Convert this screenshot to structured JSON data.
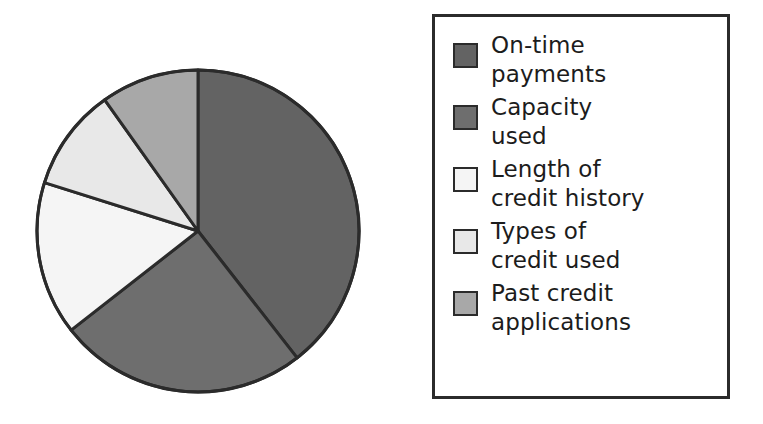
{
  "figure": {
    "kind": "pie-chart-with-legend",
    "background_color": "#ffffff",
    "outline_color": "#2b2b2b"
  },
  "legend": {
    "border_color": "#2b2b2b",
    "position": "right",
    "items": [
      {
        "label": "On-time\npayments",
        "color": "#636363",
        "swatch_name": "legend-swatch-on-time-payments"
      },
      {
        "label": "Capacity\nused",
        "color": "#6e6e6e",
        "swatch_name": "legend-swatch-capacity-used"
      },
      {
        "label": "Length of\ncredit history",
        "color": "#f5f5f5",
        "swatch_name": "legend-swatch-length-of-credit-history"
      },
      {
        "label": "Types of\ncredit used",
        "color": "#e8e8e8",
        "swatch_name": "legend-swatch-types-of-credit-used"
      },
      {
        "label": "Past credit\napplications",
        "color": "#a8a8a8",
        "swatch_name": "legend-swatch-past-credit-applications"
      }
    ]
  },
  "chart_data": {
    "type": "pie",
    "title": "",
    "labels": [
      "On-time payments",
      "Capacity used",
      "Length of credit history",
      "Types of credit used",
      "Past credit applications"
    ],
    "values": [
      39.4,
      25.0,
      15.4,
      10.3,
      9.9
    ],
    "unit": "percent",
    "colors": [
      "#636363",
      "#6e6e6e",
      "#f5f5f5",
      "#e8e8e8",
      "#a8a8a8"
    ],
    "start_angle_deg": 0,
    "direction": "clockwise",
    "slice_boundaries_deg": [
      0,
      142,
      232,
      287.5,
      324.6,
      360
    ],
    "center_px": [
      198,
      231
    ],
    "radius_px": 161,
    "legend": true,
    "legend_position": "right",
    "grid": false,
    "data_labels": false
  }
}
